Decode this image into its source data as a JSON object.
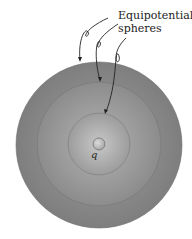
{
  "label": {
    "line1": "Equipotential",
    "line2": "spheres"
  },
  "charge_label": "q",
  "colors": {
    "outer": "#8a8a8a",
    "middle": "#999999",
    "inner": "#a9a9a9",
    "charge": "#b5b5b5",
    "arrows": "#222222"
  }
}
